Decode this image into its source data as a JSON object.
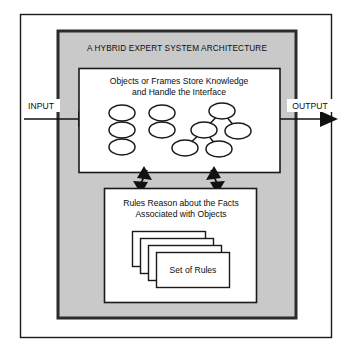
{
  "figure": {
    "title": "A HYBRID EXPERT SYSTEM ARCHITECTURE",
    "type": "block-diagram"
  },
  "colors": {
    "page_background": "#ffffff",
    "panel_fill": "#c9c9c9",
    "panel_border": "#2b2b2b",
    "box_fill": "#ffffff",
    "box_border": "#1a1a1a",
    "line": "#111111",
    "text": "#0d0d0d"
  },
  "io": {
    "input_label": "INPUT",
    "output_label": "OUTPUT"
  },
  "objects_box": {
    "line1": "Objects or Frames Store Knowledge",
    "line2": "and Handle the Interface",
    "network": {
      "clusters": [
        {
          "name": "left-chain",
          "nodes": [
            {
              "id": "n1",
              "cx": 122,
              "cy": 113
            },
            {
              "id": "n2",
              "cx": 122,
              "cy": 130
            },
            {
              "id": "n3",
              "cx": 122,
              "cy": 147
            }
          ],
          "edges": [
            [
              "n1",
              "n2"
            ],
            [
              "n2",
              "n3"
            ]
          ]
        },
        {
          "name": "middle-chain",
          "nodes": [
            {
              "id": "m1",
              "cx": 162,
              "cy": 113
            },
            {
              "id": "m2",
              "cx": 162,
              "cy": 130
            }
          ],
          "edges": [
            [
              "m1",
              "m2"
            ]
          ]
        },
        {
          "name": "right-tree",
          "nodes": [
            {
              "id": "r1",
              "cx": 222,
              "cy": 111
            },
            {
              "id": "r2",
              "cx": 204,
              "cy": 130
            },
            {
              "id": "r3",
              "cx": 238,
              "cy": 131
            },
            {
              "id": "r4",
              "cx": 185,
              "cy": 148
            },
            {
              "id": "r5",
              "cx": 219,
              "cy": 149
            }
          ],
          "edges": [
            [
              "r1",
              "r2"
            ],
            [
              "r1",
              "r3"
            ],
            [
              "r2",
              "r4"
            ],
            [
              "r2",
              "r5"
            ]
          ]
        }
      ]
    }
  },
  "rules_box": {
    "line1": "Rules Reason about the Facts",
    "line2": "Associated with Objects",
    "card_stack": {
      "count": 4,
      "front_label": "Set of Rules"
    }
  },
  "connectors": {
    "left_arrow": "double-headed-arrow",
    "right_arrow": "double-headed-arrow"
  }
}
